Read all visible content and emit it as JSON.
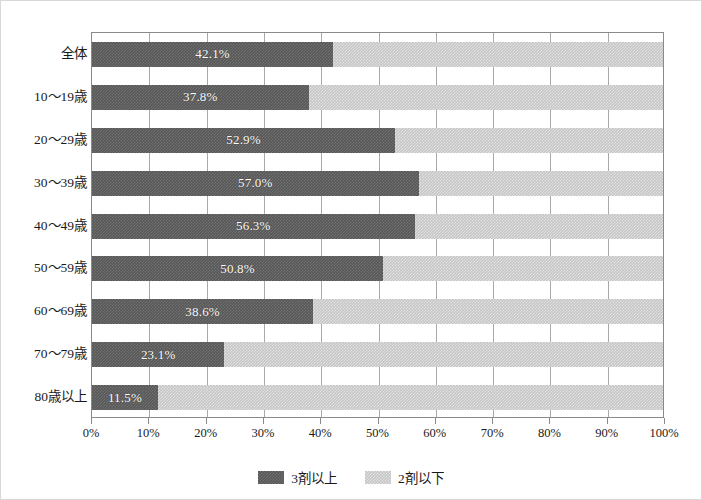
{
  "chart_data": {
    "type": "bar",
    "orientation": "horizontal",
    "stacked": true,
    "normalized_percent": true,
    "title": "",
    "subtitle": "",
    "xlabel": "",
    "ylabel": "",
    "xlim": [
      0,
      100
    ],
    "grid": true,
    "grid_axis": "x",
    "legend_position": "bottom-center",
    "categories": [
      "全体",
      "10〜19歳",
      "20〜29歳",
      "30〜39歳",
      "40〜49歳",
      "50〜59歳",
      "60〜69歳",
      "70〜79歳",
      "80歳以上"
    ],
    "series": [
      {
        "name": "3剤以上",
        "color": "#585858",
        "values": [
          42.1,
          37.8,
          52.9,
          57.0,
          56.3,
          50.8,
          38.6,
          23.1,
          11.5
        ],
        "labels": [
          "42.1%",
          "37.8%",
          "52.9%",
          "57.0%",
          "56.3%",
          "50.8%",
          "38.6%",
          "23.1%",
          "11.5%"
        ]
      },
      {
        "name": "2剤以下",
        "color": "#c6c6c6",
        "values": [
          57.9,
          62.2,
          47.1,
          43.0,
          43.7,
          49.2,
          61.4,
          76.9,
          88.5
        ],
        "labels": [
          "",
          "",
          "",
          "",
          "",
          "",
          "",
          "",
          ""
        ]
      }
    ],
    "xticks": [
      0,
      10,
      20,
      30,
      40,
      50,
      60,
      70,
      80,
      90,
      100
    ],
    "xticklabels": [
      "0%",
      "10%",
      "20%",
      "30%",
      "40%",
      "50%",
      "60%",
      "70%",
      "80%",
      "90%",
      "100%"
    ]
  },
  "legend": {
    "items": [
      {
        "label": "3剤以上",
        "swatch": "dark-gray-swatch-icon"
      },
      {
        "label": "2剤以下",
        "swatch": "light-gray-swatch-icon"
      }
    ]
  },
  "colors": {
    "series_dark": "#585858",
    "series_light": "#c6c6c6",
    "gridline": "#a9a9a9",
    "axis": "#8a8a8a",
    "frame": "#d8d8d8",
    "text": "#1a1a1a",
    "value_label": "#ffffff"
  }
}
